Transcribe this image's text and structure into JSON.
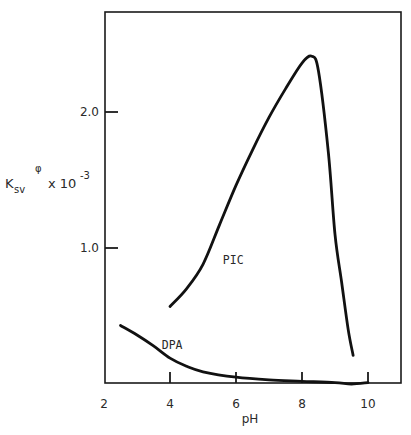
{
  "chart_data": {
    "type": "line",
    "title": "",
    "xlabel": "pH",
    "ylabel": "K_sv^φ x 10^-3",
    "ylabel_parts": {
      "base": "K",
      "subscript": "sv",
      "superscript": "φ",
      "multiplier": "x 10",
      "exponent": "-3"
    },
    "xlim": [
      2,
      11
    ],
    "ylim": [
      0,
      2.73
    ],
    "xticks": [
      2,
      4,
      6,
      8,
      10
    ],
    "xtick_labels": [
      "2",
      "4",
      "6",
      "8",
      "10"
    ],
    "yticks": [
      1.0,
      2.0
    ],
    "ytick_labels": [
      "1.0",
      "2.0"
    ],
    "grid": false,
    "legend": "none (inline curve labels)",
    "series": [
      {
        "name": "PIC",
        "label_position": {
          "x": 5.6,
          "y": 0.88
        },
        "points": [
          {
            "x": 4.0,
            "y": 0.57
          },
          {
            "x": 4.5,
            "y": 0.7
          },
          {
            "x": 5.0,
            "y": 0.88
          },
          {
            "x": 5.5,
            "y": 1.17
          },
          {
            "x": 6.0,
            "y": 1.46
          },
          {
            "x": 6.5,
            "y": 1.72
          },
          {
            "x": 7.0,
            "y": 1.96
          },
          {
            "x": 7.5,
            "y": 2.17
          },
          {
            "x": 8.0,
            "y": 2.36
          },
          {
            "x": 8.3,
            "y": 2.41
          },
          {
            "x": 8.5,
            "y": 2.3
          },
          {
            "x": 8.8,
            "y": 1.7
          },
          {
            "x": 9.0,
            "y": 1.1
          },
          {
            "x": 9.2,
            "y": 0.75
          },
          {
            "x": 9.4,
            "y": 0.4
          },
          {
            "x": 9.55,
            "y": 0.21
          }
        ]
      },
      {
        "name": "DPA",
        "label_position": {
          "x": 3.75,
          "y": 0.26
        },
        "points": [
          {
            "x": 2.5,
            "y": 0.43
          },
          {
            "x": 3.0,
            "y": 0.36
          },
          {
            "x": 3.5,
            "y": 0.28
          },
          {
            "x": 4.0,
            "y": 0.19
          },
          {
            "x": 4.5,
            "y": 0.13
          },
          {
            "x": 5.0,
            "y": 0.09
          },
          {
            "x": 6.0,
            "y": 0.05
          },
          {
            "x": 7.0,
            "y": 0.03
          },
          {
            "x": 8.0,
            "y": 0.02
          },
          {
            "x": 9.0,
            "y": 0.01
          },
          {
            "x": 9.5,
            "y": 0.0
          },
          {
            "x": 10.0,
            "y": 0.01
          }
        ]
      }
    ]
  },
  "colors": {
    "line": "#111111",
    "axis": "#1a1a1a",
    "background": "#ffffff"
  }
}
